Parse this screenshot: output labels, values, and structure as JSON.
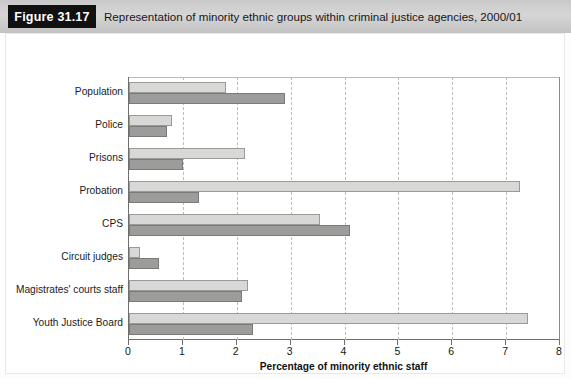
{
  "figure": {
    "tag": "Figure 31.17",
    "caption": "Representation of minority ethnic groups within criminal justice agencies, 2000/01"
  },
  "colors": {
    "asian": "#9c9c9a",
    "black": "#d8d8d6",
    "header_band": "#cccccc",
    "tag_background": "#111111",
    "axis": "#6e6e6e",
    "gridline": "#bdbdbd"
  },
  "legend": {
    "position": "bottom-left",
    "items": [
      {
        "label": "Asian",
        "color": "#9c9c9a"
      },
      {
        "label": "Black",
        "color": "#d8d8d6"
      }
    ]
  },
  "chart_data": {
    "type": "bar",
    "orientation": "horizontal",
    "title": "Representation of minority ethnic groups within criminal justice agencies, 2000/01",
    "xlabel": "Percentage of minority ethnic staff",
    "ylabel": "",
    "xlim": [
      0,
      8
    ],
    "xticks": [
      0,
      1,
      2,
      3,
      4,
      5,
      6,
      7,
      8
    ],
    "xtick_labels": [
      "0",
      "1",
      "2",
      "3",
      "4",
      "5",
      "6",
      "7",
      "8"
    ],
    "grid": true,
    "grid_axis": "x",
    "categories": [
      "Population",
      "Police",
      "Prisons",
      "Probation",
      "CPS",
      "Circuit judges",
      "Magistrates' courts staff",
      "Youth Justice Board"
    ],
    "series": [
      {
        "name": "Black",
        "color": "#d8d8d6",
        "values": [
          1.8,
          0.8,
          2.15,
          7.25,
          3.55,
          0.2,
          2.2,
          7.4
        ]
      },
      {
        "name": "Asian",
        "color": "#9c9c9a",
        "values": [
          2.9,
          0.7,
          1.0,
          1.3,
          4.1,
          0.55,
          2.1,
          2.3
        ]
      }
    ]
  }
}
